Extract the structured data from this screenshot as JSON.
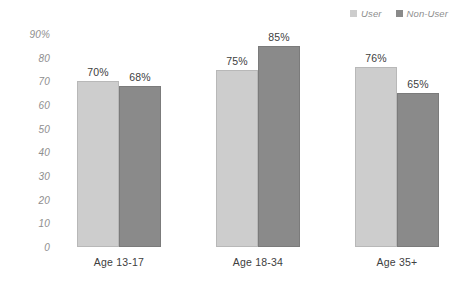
{
  "chart_data": {
    "type": "bar",
    "title": "",
    "subtitle": "",
    "xlabel": "",
    "ylabel": "",
    "categories": [
      "Age 13-17",
      "Age 18-34",
      "Age 35+"
    ],
    "series": [
      {
        "name": "User",
        "color": "#cdcdcd",
        "values": [
          70,
          68,
          0
        ]
      },
      {
        "name": "Non-User",
        "color": "#8a8a8a",
        "values": [
          0,
          0,
          0
        ]
      }
    ],
    "groups": [
      {
        "category": "Age 13-17",
        "bars": [
          {
            "series": "User",
            "value": 70,
            "label": "70%"
          },
          {
            "series": "Non-User",
            "value": 68,
            "label": "68%"
          }
        ]
      },
      {
        "category": "Age 18-34",
        "bars": [
          {
            "series": "User",
            "value": 75,
            "label": "75%"
          },
          {
            "series": "Non-User",
            "value": 85,
            "label": "85%"
          }
        ]
      },
      {
        "category": "Age 35+",
        "bars": [
          {
            "series": "User",
            "value": 76,
            "label": "76%"
          },
          {
            "series": "Non-User",
            "value": 65,
            "label": "65%"
          }
        ]
      }
    ],
    "ylim": [
      0,
      90
    ],
    "ytick_labels": [
      "90%",
      "80",
      "70",
      "60",
      "50",
      "40",
      "30",
      "20",
      "10",
      "0"
    ],
    "ytick_values": [
      90,
      80,
      70,
      60,
      50,
      40,
      30,
      20,
      10,
      0
    ],
    "grid": false,
    "legend": {
      "position": "top-right",
      "entries": [
        {
          "label": "User",
          "color": "#cdcdcd"
        },
        {
          "label": "Non-User",
          "color": "#8a8a8a"
        }
      ]
    },
    "colors": {
      "user": "#cdcdcd",
      "non_user": "#8a8a8a",
      "axis_text": "#8e8e8e",
      "label_text": "#404040",
      "background": "#ffffff"
    }
  }
}
